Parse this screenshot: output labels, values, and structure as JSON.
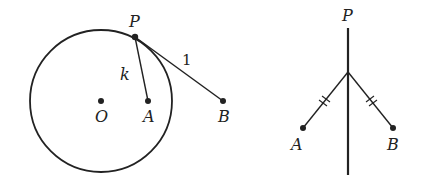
{
  "figure_left": {
    "labels": {
      "P": "P",
      "O": "O",
      "A": "A",
      "B": "B",
      "k": "k",
      "one": "1"
    },
    "circle": {
      "cx": 101,
      "cy": 101,
      "r": 71
    },
    "points": {
      "P": [
        135,
        37
      ],
      "O": [
        101,
        101
      ],
      "A": [
        148,
        101
      ],
      "B": [
        223,
        101
      ]
    },
    "segments": [
      {
        "from": "P",
        "to": "A",
        "label": "k"
      },
      {
        "from": "P",
        "to": "B",
        "label": "1"
      }
    ]
  },
  "figure_right": {
    "labels": {
      "P": "P",
      "A": "A",
      "B": "B"
    },
    "vertical_line": {
      "x": 348,
      "y1": 28,
      "y2": 175
    },
    "junction": [
      348,
      72
    ],
    "points": {
      "A": [
        303,
        128
      ],
      "B": [
        393,
        128
      ]
    },
    "tick_marks": "double ticks on both slanted segments (equal lengths)"
  },
  "colors": {
    "stroke": "#222222",
    "background": "#ffffff"
  }
}
